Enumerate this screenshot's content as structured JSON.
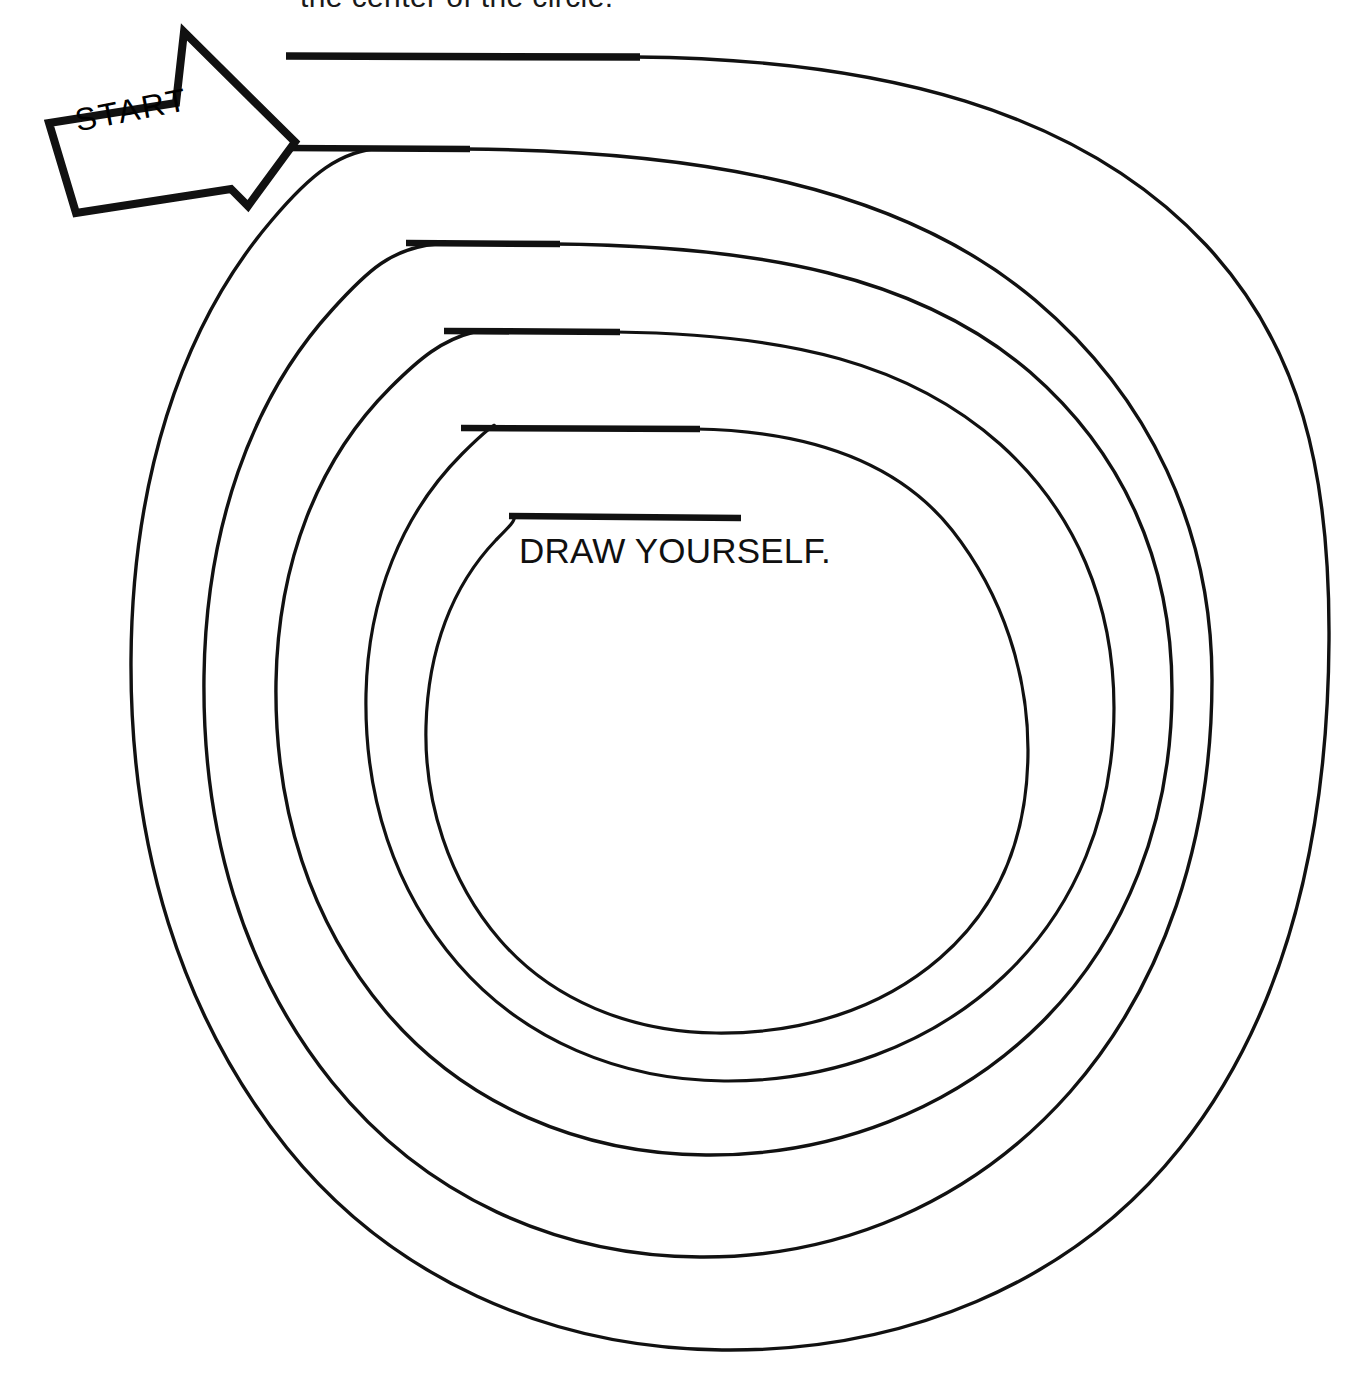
{
  "page": {
    "type": "worksheet",
    "background_color": "#ffffff",
    "ink_color": "#111111",
    "width": 1366,
    "height": 1375
  },
  "heading": {
    "text": "the center of the circle.",
    "note": "clipped at top edge of image"
  },
  "start_marker": {
    "label": "START",
    "icon": "right-arrow-icon",
    "rotation_degrees": -11
  },
  "center": {
    "prompt": "DRAW YOURSELF."
  },
  "spiral": {
    "arm_count": 5,
    "description": "five concentric hand-drawn spiral arms forming a maze path from the START arrow to the center",
    "arms": [
      {
        "index": 1,
        "lead_in_label": "outermost-lead-line"
      },
      {
        "index": 2,
        "lead_in_label": "second-lead-line"
      },
      {
        "index": 3,
        "lead_in_label": "third-lead-line"
      },
      {
        "index": 4,
        "lead_in_label": "fourth-lead-line"
      },
      {
        "index": 5,
        "lead_in_label": "innermost-lead-line"
      }
    ]
  }
}
